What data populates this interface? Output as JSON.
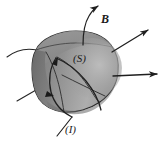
{
  "figure": {
    "background_color": "#ffffff",
    "width": 166,
    "height": 146,
    "labels": {
      "field_label": "B",
      "surface_label": "(S)",
      "circuit_label": "(I)"
    },
    "label_meanings": {
      "field_label": "magnetic field vector B",
      "surface_label": "surface S",
      "circuit_label": "current loop I"
    },
    "colors": {
      "ink": "#1a1a1a",
      "outline": "#2a2a2a",
      "surface_dark": "#6f6f6f",
      "surface_mid": "#8a8a8a",
      "surface_light": "#ababab",
      "surface_highlight": "#bdbdbd",
      "shadow": "#5a5a5a"
    },
    "elements": [
      {
        "name": "surface-patch",
        "type": "shaded-curved-surface"
      },
      {
        "name": "field-line-top",
        "type": "curved-arrow",
        "direction": "up-left"
      },
      {
        "name": "field-line-upper-right",
        "type": "straight-arrow",
        "direction": "up-right"
      },
      {
        "name": "field-line-right",
        "type": "straight-arrow",
        "direction": "right"
      },
      {
        "name": "field-line-left",
        "type": "curve",
        "direction": "entering-left"
      },
      {
        "name": "field-line-lower-left",
        "type": "straight-line",
        "direction": "entering-lower-left"
      },
      {
        "name": "circuit-boundary",
        "type": "closed-curve-with-arrowheads"
      }
    ],
    "arrow_count": 3,
    "arrowhead_count_on_circuit": 2
  }
}
